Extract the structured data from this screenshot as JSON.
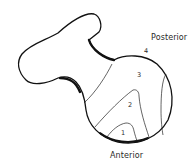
{
  "diagram": {
    "type": "anatomical-outline",
    "stroke_color": "#111111",
    "labels": {
      "posterior": "Posterior",
      "anterior": "Anterior"
    },
    "regions": [
      {
        "id": "1",
        "label": "1"
      },
      {
        "id": "2",
        "label": "2"
      },
      {
        "id": "3",
        "label": "3"
      },
      {
        "id": "4",
        "label": "4"
      }
    ]
  }
}
